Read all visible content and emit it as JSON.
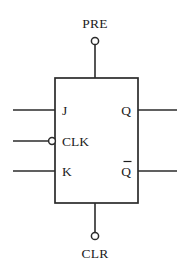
{
  "diagram": {
    "component_type": "jk-flip-flop",
    "background_color": "#ffffff",
    "line_color": "#2b2b2b",
    "text_color": "#1c1c1c"
  },
  "body": {
    "x": 55,
    "y": 78,
    "width": 83,
    "height": 125
  },
  "inputs": [
    {
      "id": "j",
      "label": "J",
      "side": "left",
      "y": 110,
      "inverted": false,
      "wire_start_x": 13,
      "wire_end_x": 55,
      "label_x": 62
    },
    {
      "id": "clk",
      "label": "CLK",
      "side": "left",
      "y": 141,
      "inverted": true,
      "wire_start_x": 13,
      "wire_end_x": 49,
      "label_x": 62,
      "bubble_cx": 52,
      "bubble_cy": 141,
      "bubble_r": 3.4
    },
    {
      "id": "k",
      "label": "K",
      "side": "left",
      "y": 171,
      "inverted": false,
      "wire_start_x": 13,
      "wire_end_x": 55,
      "label_x": 62
    }
  ],
  "outputs": [
    {
      "id": "q",
      "label": "Q",
      "overline": false,
      "side": "right",
      "y": 110,
      "wire_start_x": 138,
      "wire_end_x": 177,
      "label_x": 131
    },
    {
      "id": "q-not",
      "label": "Q",
      "overline": true,
      "side": "right",
      "y": 171,
      "wire_start_x": 138,
      "wire_end_x": 177,
      "label_x": 131
    }
  ],
  "controls": [
    {
      "id": "pre",
      "label": "PRE",
      "side": "top",
      "x": 95,
      "label_y": 28,
      "terminal_cx": 95,
      "terminal_cy": 41,
      "terminal_r": 3.6,
      "wire_y_start": 45,
      "wire_y_end": 78
    },
    {
      "id": "clr",
      "label": "CLR",
      "side": "bottom",
      "x": 95,
      "label_y": 258,
      "terminal_cx": 95,
      "terminal_cy": 236,
      "terminal_r": 3.6,
      "wire_y_start": 203,
      "wire_y_end": 232
    }
  ]
}
